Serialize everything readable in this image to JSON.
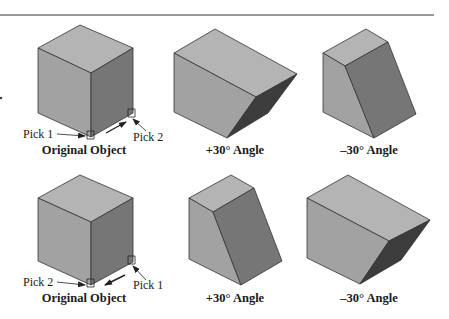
{
  "figure": {
    "rows": [
      {
        "name": "row-1",
        "captions": [
          "Original Object",
          "+30° Angle",
          "–30° Angle"
        ],
        "picks": {
          "left": "Pick 1",
          "right": "Pick 2"
        }
      },
      {
        "name": "row-2",
        "captions": [
          "Original Object",
          "+30° Angle",
          "–30° Angle"
        ],
        "picks": {
          "left": "Pick 2",
          "right": "Pick 1"
        }
      }
    ],
    "colors": {
      "top_face": "#b4b4b4",
      "left_face": "#a2a2a2",
      "right_face": "#767676",
      "dark_face": "#3c3c3c",
      "edge": "#333333",
      "rule": "#333333"
    }
  }
}
